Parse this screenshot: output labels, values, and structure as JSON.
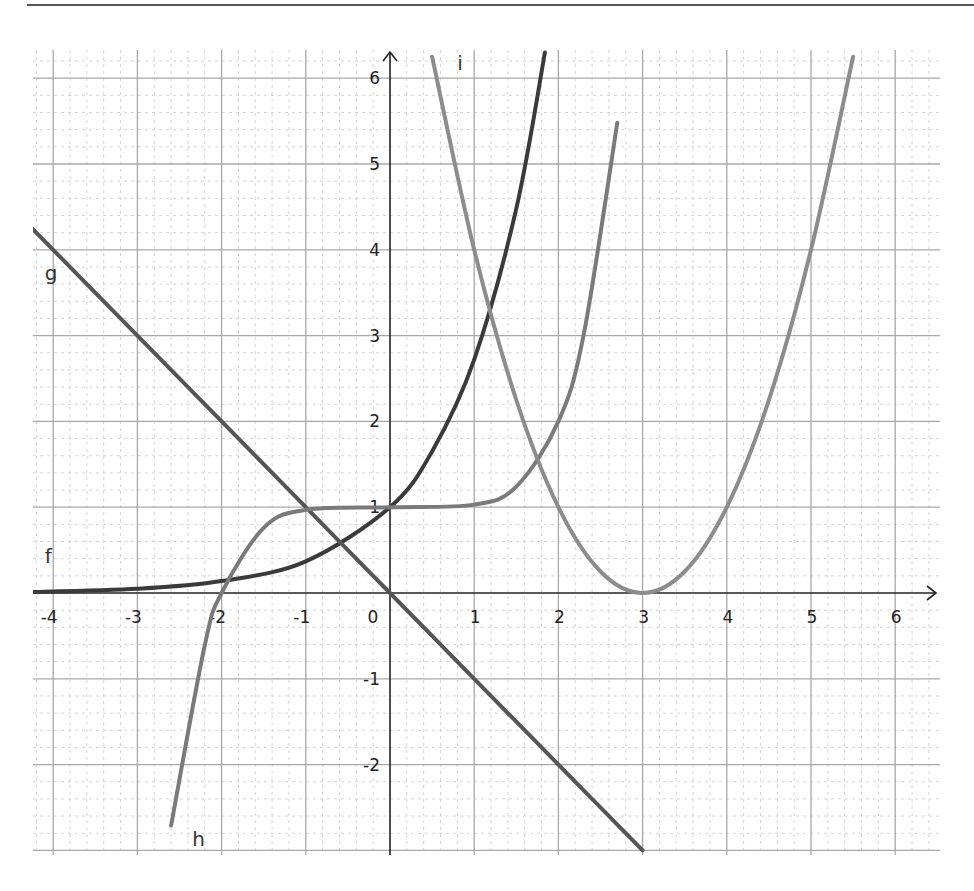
{
  "chart_data": {
    "type": "line",
    "title": "",
    "xlabel": "",
    "ylabel": "",
    "xlim": [
      -4.3,
      6.5
    ],
    "ylim": [
      -3,
      6.3
    ],
    "grid": {
      "major": true,
      "minor_step": 0.2
    },
    "x_ticks": [
      -4,
      -3,
      -2,
      -1,
      0,
      1,
      2,
      3,
      4,
      5,
      6
    ],
    "x_tick_labels": [
      "-4",
      "-3",
      "-2",
      "-1",
      "0",
      "1",
      "2",
      "3",
      "4",
      "5",
      "6"
    ],
    "y_ticks": [
      -2,
      -1,
      1,
      2,
      3,
      4,
      5,
      6
    ],
    "y_tick_labels": [
      "-2",
      "-1",
      "1",
      "2",
      "3",
      "4",
      "5",
      "6"
    ],
    "series": [
      {
        "name": "f",
        "description": "exponential-like, approx e^x",
        "color": "#3a3a3a",
        "x": [
          -4.3,
          -3,
          -2,
          -1,
          0,
          0.5,
          1,
          1.5,
          1.84
        ],
        "y": [
          0.01,
          0.05,
          0.14,
          0.37,
          1,
          1.65,
          2.72,
          4.48,
          6.3
        ]
      },
      {
        "name": "g",
        "description": "line, approx -x",
        "color": "#555555",
        "x": [
          -4.3,
          -3,
          -1,
          0,
          1,
          2,
          3
        ],
        "y": [
          4.3,
          3,
          1,
          0,
          -1,
          -2,
          -3
        ]
      },
      {
        "name": "h",
        "description": "flat near y=1, approx x^5/32+1",
        "color": "#7a7a7a",
        "x": [
          -2.6,
          -2.2,
          -2,
          -1.5,
          -1,
          0,
          1,
          1.5,
          2,
          2.3,
          2.7
        ],
        "y": [
          -2.71,
          -0.61,
          0,
          0.76,
          0.97,
          1,
          1.03,
          1.24,
          2,
          3.01,
          5.48
        ]
      },
      {
        "name": "i",
        "description": "parabola, approx (x-3)^2",
        "color": "#8c8c8c",
        "x": [
          0.5,
          1,
          1.5,
          2,
          2.5,
          3,
          3.5,
          4,
          4.5,
          5,
          5.5
        ],
        "y": [
          6.25,
          4,
          2.25,
          1,
          0.25,
          0,
          0.25,
          1,
          2.25,
          4,
          6.25
        ]
      }
    ],
    "labels": [
      {
        "text": "f",
        "x": -4.1,
        "y": 0.35
      },
      {
        "text": "g",
        "x": -4.1,
        "y": 3.65
      },
      {
        "text": "h",
        "x": -2.35,
        "y": -2.95
      },
      {
        "text": "i",
        "x": 0.8,
        "y": 6.1
      }
    ]
  }
}
